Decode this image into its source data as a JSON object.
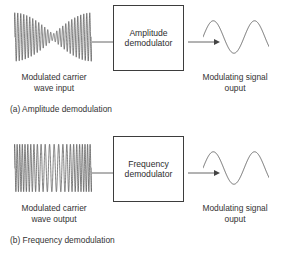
{
  "figure": {
    "background_color": "#ffffff",
    "line_color": "#555555",
    "box_border_color": "#3d3d3d",
    "text_color": "#333333"
  },
  "panels": [
    {
      "id": "amplitude-demodulation",
      "input_waveform": "amplitude-modulated-carrier-waveform",
      "output_waveform": "sine-wave",
      "box": {
        "line1": "Amplitude",
        "line2": "demodulator"
      },
      "input_label": {
        "line1": "Modulated carrier",
        "line2": "wave input"
      },
      "output_label": {
        "line1": "Modulating signal",
        "line2": "ouput"
      },
      "caption": "(a) Amplitude demodulation"
    },
    {
      "id": "frequency-demodulation",
      "input_waveform": "frequency-modulated-carrier-waveform",
      "output_waveform": "sine-wave",
      "box": {
        "line1": "Frequency",
        "line2": "demodulator"
      },
      "input_label": {
        "line1": "Modulated carrier",
        "line2": "wave output"
      },
      "output_label": {
        "line1": "Modulating signal",
        "line2": "ouput"
      },
      "caption": "(b) Frequency demodulation"
    }
  ]
}
